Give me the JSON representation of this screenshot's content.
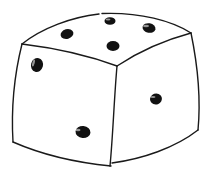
{
  "image": {
    "subject": "hand-drawn six-sided die",
    "style": "black ink line drawing on white",
    "colors": {
      "background": "#ffffff",
      "outline": "#1a1a1a",
      "pip": "#111111"
    }
  },
  "die": {
    "faces": [
      {
        "name": "top",
        "pip_count": 4,
        "pips": [
          [
            110,
            21
          ],
          [
            67,
            34
          ],
          [
            149,
            28
          ],
          [
            113,
            46
          ]
        ]
      },
      {
        "name": "left",
        "pip_count": 2,
        "pips": [
          [
            37,
            65
          ],
          [
            83,
            132
          ]
        ]
      },
      {
        "name": "right",
        "pip_count": 1,
        "pips": [
          [
            156,
            99
          ]
        ]
      }
    ]
  }
}
